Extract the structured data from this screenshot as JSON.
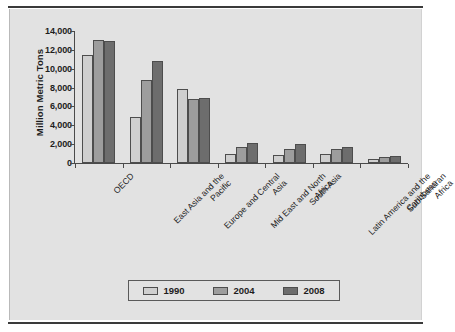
{
  "figure": {
    "background_color": "#e2e2e2",
    "rule_color": "#3a3a3a"
  },
  "chart_data": {
    "type": "bar",
    "title": "",
    "subtitle": "",
    "xlabel": "",
    "ylabel": "Million Metric Tons",
    "ylim": [
      0,
      14000
    ],
    "yticks": [
      "0",
      "2,000",
      "4,000",
      "6,000",
      "8,000",
      "10,000",
      "12,000",
      "14,000"
    ],
    "ytick_values": [
      0,
      2000,
      4000,
      6000,
      8000,
      10000,
      12000,
      14000
    ],
    "grid": false,
    "legend_position": "bottom",
    "categories": [
      "OECD",
      "East Asia and the Pacific",
      "Europe and Central Asia",
      "Mid East and North Africa",
      "South Asia",
      "Latin America and the Caribbean",
      "Sub-Saharan Africa"
    ],
    "category_lines": [
      [
        "OECD"
      ],
      [
        "East Asia and the",
        "Pacific"
      ],
      [
        "Europe and Central",
        "Asia"
      ],
      [
        "Mid East and North",
        "Africa"
      ],
      [
        "South Asia"
      ],
      [
        "Latin America and the",
        "Caribbean"
      ],
      [
        "Sub-Saharan",
        "Africa"
      ]
    ],
    "series": [
      {
        "name": "1990",
        "color": "#cfcfcf",
        "values": [
          11500,
          4900,
          7900,
          950,
          800,
          1000,
          450
        ]
      },
      {
        "name": "2004",
        "color": "#9d9d9d",
        "values": [
          13000,
          8800,
          6800,
          1700,
          1500,
          1450,
          650
        ]
      },
      {
        "name": "2008",
        "color": "#6d6d6d",
        "values": [
          12900,
          10800,
          6900,
          2100,
          2000,
          1700,
          700
        ]
      }
    ]
  },
  "legend": {
    "items": [
      {
        "label": "1990",
        "color": "#cfcfcf"
      },
      {
        "label": "2004",
        "color": "#9d9d9d"
      },
      {
        "label": "2008",
        "color": "#6d6d6d"
      }
    ]
  }
}
